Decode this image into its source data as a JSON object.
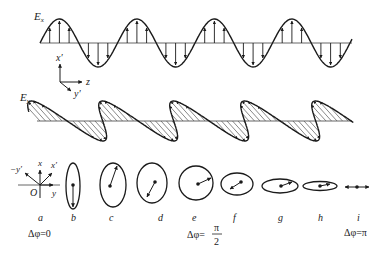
{
  "labels": {
    "ex": "E",
    "ex_sub": "x",
    "ey": "E",
    "ey_sub": "y",
    "axis_x_prime": "x′",
    "axis_z": "z",
    "axis_y_prime": "y′",
    "coord_neg_y_prime": "−y′",
    "coord_x": "x",
    "coord_x_prime": "x′",
    "coord_origin": "O",
    "coord_y": "y"
  },
  "states": [
    {
      "id": "a",
      "label": "a",
      "phase": "Δφ=0"
    },
    {
      "id": "b",
      "label": "b"
    },
    {
      "id": "c",
      "label": "c"
    },
    {
      "id": "d",
      "label": "d"
    },
    {
      "id": "e",
      "label": "e",
      "phase_prefix": "Δφ=",
      "phase_num": "π",
      "phase_den": "2"
    },
    {
      "id": "f",
      "label": "f"
    },
    {
      "id": "g",
      "label": "g"
    },
    {
      "id": "h",
      "label": "h"
    },
    {
      "id": "i",
      "label": "i",
      "phase": "Δφ=π"
    }
  ],
  "colors": {
    "stroke": "#1a1a1a",
    "hatch": "#555555"
  }
}
